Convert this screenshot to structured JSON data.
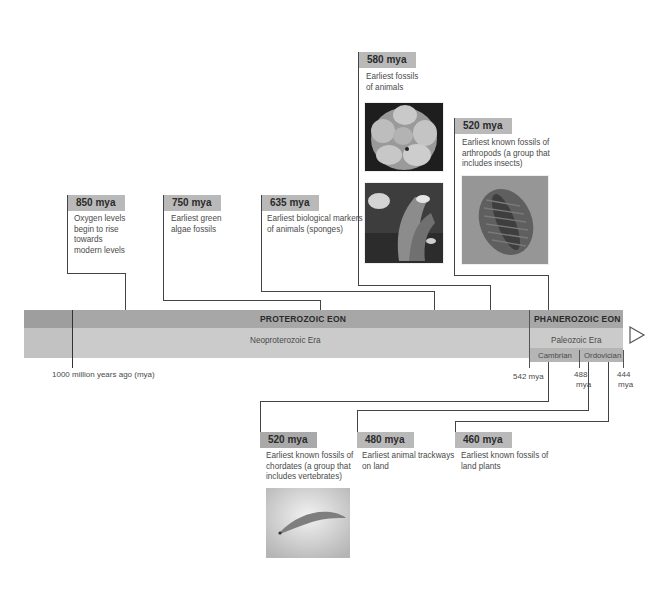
{
  "timeline": {
    "eons": [
      {
        "name": "PROTEROZOIC EON",
        "era": "Neoproterozoic Era"
      },
      {
        "name": "PHANEROZOIC EON",
        "era": "Paleozoic Era",
        "periods": [
          "Cambrian",
          "Ordovician"
        ]
      }
    ],
    "ticks": [
      {
        "label": "1000 million years ago (mya)"
      },
      {
        "label": "542 mya"
      },
      {
        "label_line1": "488",
        "label_line2": "mya"
      },
      {
        "label_line1": "444",
        "label_line2": "mya"
      }
    ],
    "arrow_icon": "triangle-right-outline"
  },
  "events_above": [
    {
      "date": "850 mya",
      "text": [
        "Oxygen levels",
        "begin to rise",
        "towards",
        "modern levels"
      ]
    },
    {
      "date": "750 mya",
      "text": [
        "Earliest green",
        "algae fossils"
      ]
    },
    {
      "date": "635 mya",
      "text": [
        "Earliest biological markers",
        "of animals (sponges)"
      ]
    },
    {
      "date": "580 mya",
      "text": [
        "Earliest fossils",
        "of animals"
      ],
      "images": [
        "embryo-fossil-photo",
        "ediacaran-organisms-photo"
      ]
    },
    {
      "date": "520 mya",
      "text": [
        "Earliest known fossils of",
        "arthropods (a group that",
        "includes insects)"
      ],
      "images": [
        "trilobite-fossil-photo"
      ]
    }
  ],
  "events_below": [
    {
      "date": "520 mya",
      "text": [
        "Earliest known fossils of",
        "chordates (a group that",
        "includes vertebrates)"
      ],
      "images": [
        "chordate-fossil-photo"
      ]
    },
    {
      "date": "480 mya",
      "text": [
        "Earliest animal trackways",
        "on land"
      ]
    },
    {
      "date": "460 mya",
      "text": [
        "Earliest known fossils of",
        "land plants"
      ]
    }
  ],
  "colors": {
    "label_bg": "#b9b9b9",
    "eon_band": "#a7a7a7",
    "era_band": "#cbcbcb",
    "line": "#444444"
  }
}
